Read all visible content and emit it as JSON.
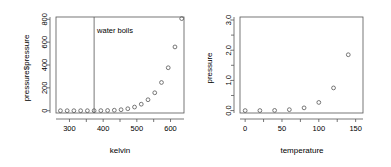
{
  "figure": {
    "background": "#ffffff",
    "foreground": "#555555",
    "panels": 2
  },
  "chart_data": [
    {
      "id": "kelvin-panel",
      "type": "scatter",
      "title": "",
      "xlabel": "kelvin",
      "ylabel": "pressure$pressure",
      "xlim": [
        260,
        640
      ],
      "ylim": [
        -20,
        820
      ],
      "grid": false,
      "legend": null,
      "point_marker": "open-circle",
      "xticks": [
        300,
        400,
        500,
        600
      ],
      "xticks_minor": [
        250,
        350,
        450,
        550,
        650
      ],
      "xtick_labels": [
        "300",
        "400",
        "500",
        "600"
      ],
      "yticks": [
        0,
        200,
        400,
        600,
        800
      ],
      "ytick_labels": [
        "0",
        "200",
        "400",
        "600",
        "800"
      ],
      "x": [
        273.15,
        293.15,
        313.15,
        333.15,
        353.15,
        373.15,
        393.15,
        413.15,
        433.15,
        453.15,
        473.15,
        493.15,
        513.15,
        533.15,
        553.15,
        573.15,
        593.15,
        613.15,
        633.15
      ],
      "y": [
        0.0002,
        0.0012,
        0.006,
        0.03,
        0.09,
        0.27,
        0.75,
        1.85,
        4.2,
        8.8,
        17.3,
        32.1,
        57.0,
        96.0,
        157.0,
        247.0,
        376.0,
        558.0,
        806.0
      ],
      "annotations": [
        {
          "name": "water-boils-line",
          "kind": "vertical-line",
          "x": 373.15
        },
        {
          "name": "water-boils-label",
          "kind": "text",
          "text": "water boils",
          "x": 382,
          "y": 680
        }
      ]
    },
    {
      "id": "celsius-panel",
      "type": "scatter",
      "title": "",
      "xlabel": "temperature",
      "ylabel": "pressure",
      "xlim": [
        -7,
        160
      ],
      "ylim": [
        -0.08,
        3.1
      ],
      "grid": false,
      "legend": null,
      "point_marker": "open-circle",
      "xticks": [
        0,
        50,
        100,
        150
      ],
      "xticks_minor": [
        25,
        75,
        125
      ],
      "xtick_labels": [
        "0",
        "50",
        "100",
        "150"
      ],
      "yticks": [
        0.0,
        1.0,
        2.0,
        3.0
      ],
      "yticks_minor": [
        0.5,
        1.5,
        2.5
      ],
      "ytick_labels": [
        "0.0",
        "1.0",
        "2.0",
        "3.0"
      ],
      "x": [
        0,
        20,
        40,
        60,
        80,
        100,
        120,
        140
      ],
      "y": [
        0.0002,
        0.0012,
        0.006,
        0.03,
        0.09,
        0.27,
        0.75,
        1.85
      ],
      "annotations": []
    }
  ]
}
